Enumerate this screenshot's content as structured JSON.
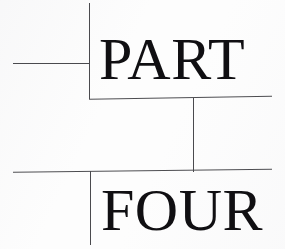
{
  "page": {
    "kind": "book-part-divider",
    "width": 285,
    "height": 249,
    "background_color": "#fdfdfd",
    "ink_color": "#100f12",
    "rule_color": "#4a4a4e"
  },
  "headings": {
    "part_label": "PART",
    "part_number_word": "FOUR"
  },
  "rules": {
    "upper_left_horizontal": {
      "x1": 13,
      "y1": 63,
      "x2": 90,
      "y2": 63
    },
    "upper_vertical": {
      "x1": 89,
      "y1": 3,
      "x2": 89,
      "y2": 98
    },
    "middle_horizontal": {
      "x1": 89,
      "y1": 99,
      "x2": 272,
      "y2": 96
    },
    "middle_vertical": {
      "x1": 193,
      "y1": 98,
      "x2": 193,
      "y2": 171
    },
    "lower_horizontal": {
      "x1": 13,
      "y1": 172,
      "x2": 272,
      "y2": 169
    },
    "lower_vertical": {
      "x1": 90,
      "y1": 171,
      "x2": 90,
      "y2": 245
    }
  }
}
